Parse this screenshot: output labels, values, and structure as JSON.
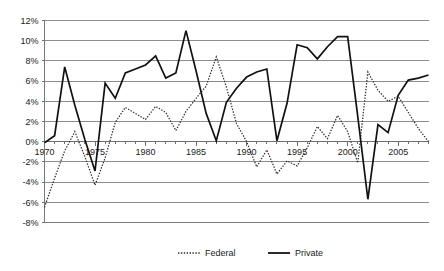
{
  "chart_data": {
    "type": "line",
    "title": "",
    "subtitle": "",
    "xlabel": "",
    "ylabel": "",
    "xlim": [
      1970,
      2008
    ],
    "ylim": [
      -8,
      12
    ],
    "ytick_step": 2,
    "grid": true,
    "legend_position": "bottom",
    "x_tick_labels": [
      "1970",
      "1975",
      "1980",
      "1985",
      "1990",
      "1995",
      "2000",
      "2005"
    ],
    "x_tick_values": [
      1970,
      1975,
      1980,
      1985,
      1990,
      1995,
      2000,
      2005
    ],
    "y_tick_labels": [
      "12%",
      "10%",
      "8%",
      "6%",
      "4%",
      "2%",
      "0%",
      "-2%",
      "-4%",
      "-6%",
      "-8%"
    ],
    "y_tick_values": [
      12,
      10,
      8,
      6,
      4,
      2,
      0,
      -2,
      -4,
      -6,
      -8
    ],
    "x": [
      1970,
      1971,
      1972,
      1973,
      1974,
      1975,
      1976,
      1977,
      1978,
      1979,
      1980,
      1981,
      1982,
      1983,
      1984,
      1985,
      1986,
      1987,
      1988,
      1989,
      1990,
      1991,
      1992,
      1993,
      1994,
      1995,
      1996,
      1997,
      1998,
      1999,
      2000,
      2001,
      2002,
      2003,
      2004,
      2005,
      2006,
      2007,
      2008
    ],
    "series": [
      {
        "name": "Federal",
        "style": "dotted",
        "color": "#2b2b2b",
        "values": [
          -6.5,
          -3.6,
          -0.9,
          1.0,
          -1.5,
          -4.3,
          -1.6,
          1.9,
          3.4,
          2.8,
          2.2,
          3.5,
          2.9,
          1.1,
          3.0,
          4.3,
          5.5,
          8.4,
          5.4,
          1.8,
          0.0,
          -2.5,
          -0.8,
          -3.2,
          -1.9,
          -2.4,
          -0.6,
          1.5,
          0.3,
          2.6,
          1.0,
          -2.1,
          6.9,
          5.1,
          4.0,
          4.5,
          2.9,
          1.3,
          0.0
        ]
      },
      {
        "name": "Private",
        "style": "solid",
        "color": "#111111",
        "values": [
          -0.1,
          0.6,
          7.4,
          3.6,
          0.2,
          -2.9,
          5.8,
          4.3,
          6.8,
          7.2,
          7.6,
          8.5,
          6.3,
          6.8,
          11.0,
          7.0,
          2.8,
          0.1,
          3.9,
          5.3,
          6.4,
          6.9,
          7.2,
          0.1,
          3.8,
          9.6,
          9.3,
          8.2,
          9.4,
          10.4,
          10.4,
          2.5,
          -5.7,
          1.7,
          0.9,
          4.6,
          6.1,
          6.3,
          6.6
        ]
      }
    ],
    "legend": [
      {
        "label": "Federal",
        "style": "dotted"
      },
      {
        "label": "Private",
        "style": "solid"
      }
    ]
  },
  "colors": {
    "background": "#ffffff",
    "grid": "#8c8c8c",
    "axis": "#7a7a7a",
    "text": "#1a1a1a"
  }
}
